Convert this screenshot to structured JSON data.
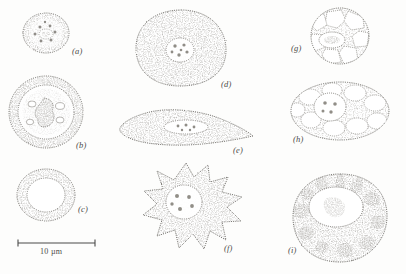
{
  "figure": {
    "type": "scientific-line-drawing-plate",
    "background_color": "#fdfdfc",
    "ink_color": "#555350",
    "stipple_color": "#6b6862",
    "granule_color": "#8d8a83",
    "panel_count": 9
  },
  "scale_bar": {
    "label": "10 µm",
    "x_start": 18,
    "x_end": 95,
    "y": 243,
    "tick_height": 7,
    "caption_x": 40,
    "caption_y": 247
  },
  "panels": [
    {
      "id": "a",
      "label": "(a)",
      "label_x": 72,
      "label_y": 46,
      "description": "small rounded cell with stippled rim and speckled cytoplasm with central nucleus",
      "cx": 46,
      "cy": 33,
      "rx": 23,
      "ry": 20,
      "nucleus": {
        "cx": 46,
        "cy": 34,
        "rx": 7,
        "ry": 5
      },
      "granule_count": 9
    },
    {
      "id": "b",
      "label": "(b)",
      "label_x": 76,
      "label_y": 140,
      "description": "thick stippled outer ring with inner clear zone and dark irregular central mass",
      "cx": 46,
      "cy": 112,
      "rx": 37,
      "ry": 36,
      "inner": {
        "cx": 46,
        "cy": 112,
        "rx": 28,
        "ry": 27
      },
      "nucleus": {
        "cx": 45,
        "cy": 112,
        "rx": 11,
        "ry": 15
      }
    },
    {
      "id": "c",
      "label": "(c)",
      "label_x": 78,
      "label_y": 204,
      "description": "simple annulus, stippled band with empty white centre",
      "cx": 46,
      "cy": 195,
      "rx": 29,
      "ry": 26,
      "inner": {
        "cx": 46,
        "cy": 195,
        "rx": 19,
        "ry": 17
      }
    },
    {
      "id": "d",
      "label": "(d)",
      "label_x": 221,
      "label_y": 79,
      "description": "large rounded amoeboid blob, evenly stippled, with central circular nucleus",
      "cx": 181,
      "cy": 48,
      "rx": 45,
      "ry": 38,
      "nucleus": {
        "cx": 180,
        "cy": 50,
        "rx": 14,
        "ry": 12
      },
      "granule_count": 6
    },
    {
      "id": "e",
      "label": "(e)",
      "label_x": 233,
      "label_y": 145,
      "description": "elongated flattened teardrop cell with elongated oval nucleus",
      "cx": 186,
      "cy": 128,
      "rx": 67,
      "ry": 17,
      "nucleus": {
        "cx": 186,
        "cy": 127,
        "rx": 22,
        "ry": 7
      }
    },
    {
      "id": "f",
      "label": "(f)",
      "label_x": 224,
      "label_y": 243,
      "description": "star-shaped spiky cell with numerous radiating points and large round nucleus",
      "cx": 186,
      "cy": 207,
      "rx": 48,
      "ry": 43,
      "spikes": 10,
      "nucleus": {
        "cx": 184,
        "cy": 202,
        "rx": 18,
        "ry": 17
      },
      "granule_count": 5
    },
    {
      "id": "g",
      "label": "(g)",
      "label_x": 291,
      "label_y": 43,
      "description": "round cell packed with large polygonal vacuoles and a central oval nucleus",
      "cx": 340,
      "cy": 36,
      "rx": 29,
      "ry": 28,
      "nucleus": {
        "cx": 332,
        "cy": 40,
        "rx": 13,
        "ry": 8
      },
      "vacuole_count": 8
    },
    {
      "id": "h",
      "label": "(h)",
      "label_x": 293,
      "label_y": 134,
      "description": "broad ellipse filled with vacuoles and a central round nucleus",
      "cx": 340,
      "cy": 111,
      "rx": 49,
      "ry": 29,
      "nucleus": {
        "cx": 330,
        "cy": 107,
        "rx": 16,
        "ry": 14
      },
      "vacuole_count": 10
    },
    {
      "id": "i",
      "label": "(i)",
      "label_x": 288,
      "label_y": 245,
      "description": "large round cell with big clear central nucleus and many dark granular inclusions",
      "cx": 340,
      "cy": 218,
      "rx": 47,
      "ry": 44,
      "nucleus": {
        "cx": 336,
        "cy": 207,
        "rx": 27,
        "ry": 20
      },
      "inclusion_count": 14
    }
  ]
}
